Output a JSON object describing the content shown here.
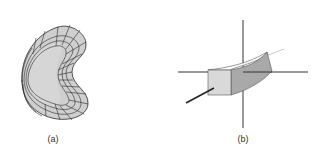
{
  "figure": {
    "panels": [
      {
        "id": "a",
        "label": "(a)",
        "description": "Kidney-shaped curved surface patch with a parametric grid mesh",
        "fill_color": "#cfcfcf",
        "line_color": "#2a2a2a"
      },
      {
        "id": "b",
        "label": "(b)",
        "description": "Curved box segment on 3D coordinate axes",
        "front_face_color": "#d9d9d9",
        "side_face_color": "#a9a9a9",
        "top_face_color": "#ffffff",
        "axis_color": "#333333"
      }
    ]
  }
}
